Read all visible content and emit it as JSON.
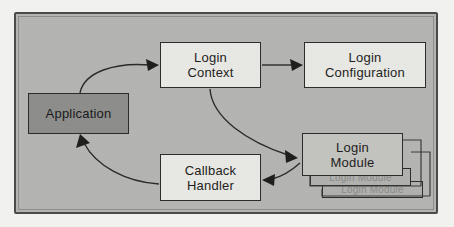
{
  "diagram": {
    "frame": {
      "background_color": "#b4b4b2",
      "border_color": "#4a4a48"
    },
    "nodes": [
      {
        "id": "application",
        "label_lines": [
          "Application"
        ],
        "line1": "Application",
        "style": "shaded",
        "fill_color": "#8d8d8b"
      },
      {
        "id": "login-context",
        "label_lines": [
          "Login",
          "Context"
        ],
        "line1": "Login",
        "line2": "Context",
        "style": "plain",
        "fill_color": "#e8e8e4"
      },
      {
        "id": "login-configuration",
        "label_lines": [
          "Login",
          "Configuration"
        ],
        "line1": "Login",
        "line2": "Configuration",
        "style": "plain",
        "fill_color": "#e8e8e4"
      },
      {
        "id": "callback-handler",
        "label_lines": [
          "Callback",
          "Handler"
        ],
        "line1": "Callback",
        "line2": "Handler",
        "style": "plain",
        "fill_color": "#e8e8e4"
      },
      {
        "id": "login-module",
        "label_lines": [
          "Login",
          "Module"
        ],
        "line1": "Login",
        "line2": "Module",
        "style": "plain",
        "fill_color": "#c3c3c0"
      },
      {
        "id": "login-module-stack-1",
        "label_lines": [
          "Login Module"
        ],
        "line1": "Login Module",
        "style": "ghost",
        "fill_color": "#b0b0ae"
      },
      {
        "id": "login-module-stack-2",
        "label_lines": [
          "Login Module"
        ],
        "line1": "Login Module",
        "style": "ghost",
        "fill_color": "#b0b0ae"
      }
    ],
    "edges": [
      {
        "id": "application-to-login-context",
        "from": "application",
        "to": "login-context",
        "shape": "curved",
        "arrow": "single"
      },
      {
        "id": "login-context-to-login-configuration",
        "from": "login-context",
        "to": "login-configuration",
        "shape": "straight",
        "arrow": "single"
      },
      {
        "id": "login-context-to-login-module",
        "from": "login-context",
        "to": "login-module",
        "shape": "curved",
        "arrow": "single"
      },
      {
        "id": "login-module-to-callback-handler",
        "from": "login-module",
        "to": "callback-handler",
        "shape": "curved",
        "arrow": "single"
      },
      {
        "id": "callback-handler-to-application",
        "from": "callback-handler",
        "to": "application",
        "shape": "curved",
        "arrow": "single"
      }
    ]
  }
}
